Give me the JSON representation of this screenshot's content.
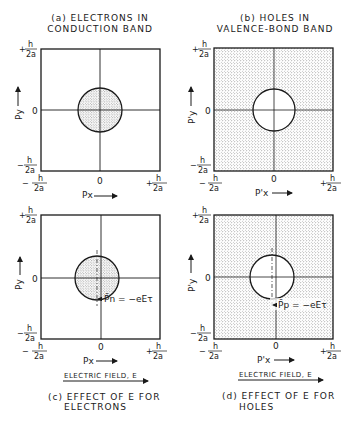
{
  "panels": [
    {
      "id": "a",
      "caption_line1": "(a) ELECTRONS IN",
      "caption_line2": "CONDUCTION BAND",
      "x_axis_label": "Px",
      "y_axis_label": "Py",
      "fill": "circle"
    },
    {
      "id": "b",
      "caption_line1": "(b) HOLES IN",
      "caption_line2": "VALENCE-BOND BAND",
      "x_axis_label": "P'x",
      "y_axis_label": "P'y",
      "fill": "outside"
    },
    {
      "id": "c",
      "caption_line1": "(c) EFFECT OF E FOR",
      "caption_line2": "ELECTRONS",
      "x_axis_label": "Px",
      "y_axis_label": "Py",
      "shift_label": "P̄n = −eEτ",
      "field_label": "ELECTRIC FIELD, E",
      "fill": "circle"
    },
    {
      "id": "d",
      "caption_line1": "(d) EFFECT OF E FOR",
      "caption_line2": "HOLES",
      "x_axis_label": "P'x",
      "y_axis_label": "P'y",
      "shift_label": "P̄p = −eEτ",
      "field_label": "ELECTRIC FIELD, E",
      "fill": "outside"
    }
  ],
  "ticks": {
    "plus": "+",
    "minus": "−",
    "numerator": "h",
    "denominator": "2a",
    "zero": "0"
  },
  "colors": {
    "ink": "#1a1a1a",
    "background": "#ffffff",
    "stipple": "#555555"
  }
}
